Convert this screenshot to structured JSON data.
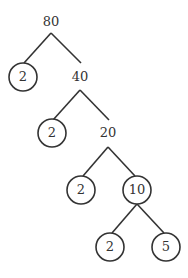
{
  "colors": {
    "stroke": "#333333",
    "background": "#ffffff"
  },
  "nodes": {
    "root": {
      "value": "80",
      "x": 51,
      "y": 22,
      "circled": false
    },
    "n40": {
      "value": "40",
      "x": 80,
      "y": 77,
      "circled": false
    },
    "p1": {
      "value": "2",
      "x": 23,
      "y": 77,
      "circled": true
    },
    "n20": {
      "value": "20",
      "x": 108,
      "y": 133,
      "circled": false
    },
    "p2": {
      "value": "2",
      "x": 52,
      "y": 133,
      "circled": true
    },
    "n10": {
      "value": "10",
      "x": 137,
      "y": 190,
      "circled": true
    },
    "p3": {
      "value": "2",
      "x": 81,
      "y": 190,
      "circled": true
    },
    "p4": {
      "value": "2",
      "x": 110,
      "y": 247,
      "circled": true
    },
    "p5": {
      "value": "5",
      "x": 166,
      "y": 247,
      "circled": true
    }
  },
  "prime_factors": [
    "2",
    "2",
    "2",
    "2",
    "5"
  ]
}
